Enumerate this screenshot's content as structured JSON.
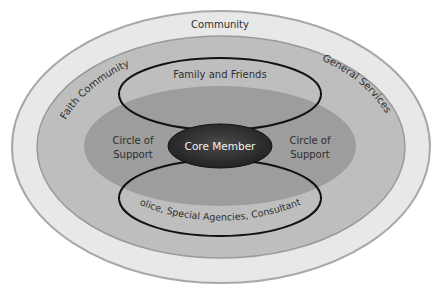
{
  "diagram": {
    "type": "concentric-ellipses",
    "layers": [
      {
        "name": "community",
        "label": "Community",
        "color": "#e6e6e6"
      },
      {
        "name": "outer-ring",
        "left_label": "Faith Community",
        "right_label": "General Services",
        "color": "#bdbdbd"
      },
      {
        "name": "circle-of-support",
        "left_label": "Circle of Support",
        "right_label": "Circle of Support",
        "color": "#9e9e9e"
      },
      {
        "name": "core",
        "label": "Core Member",
        "color": "#3a3a3a"
      }
    ],
    "loops": [
      {
        "name": "upper",
        "label": "Family and Friends"
      },
      {
        "name": "lower",
        "label": "Police, Special Agencies, Consultants"
      }
    ],
    "text": {
      "community": "Community",
      "faith": "Faith Community",
      "general": "General Services",
      "family": "Family and Friends",
      "cos_left_1": "Circle of",
      "cos_left_2": "Support",
      "cos_right_1": "Circle of",
      "cos_right_2": "Support",
      "core": "Core Member",
      "police": "Police, Special Agencies, Consultants"
    }
  }
}
